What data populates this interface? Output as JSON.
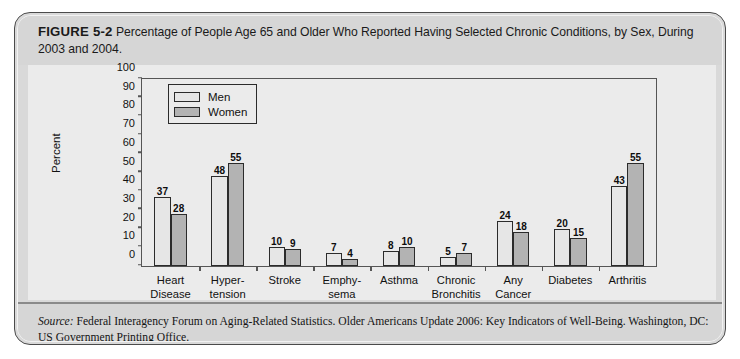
{
  "figure": {
    "label": "FIGURE 5-2",
    "caption": "Percentage of People Age 65 and Older Who Reported Having Selected Chronic Conditions, by Sex, During 2003 and 2004."
  },
  "source": {
    "prefix": "Source:",
    "text": " Federal Interagency Forum on Aging-Related Statistics. Older Americans Update 2006: Key Indicators of Well-Being. Washington, DC: US Government Printing Office."
  },
  "legend": {
    "items": [
      {
        "label": "Men",
        "color": "#e6e6e6"
      },
      {
        "label": "Women",
        "color": "#b3b3b3"
      }
    ]
  },
  "chart_data": {
    "type": "bar",
    "title": "Percentage of People Age 65 and Older Who Reported Having Selected Chronic Conditions, by Sex, During 2003 and 2004.",
    "xlabel": "",
    "ylabel": "Percent",
    "ylim": [
      0,
      100
    ],
    "yticks": [
      0,
      10,
      20,
      30,
      40,
      50,
      60,
      70,
      80,
      90,
      100
    ],
    "grid": false,
    "legend_position": "top-left",
    "categories": [
      "Heart Disease",
      "Hyper-tension",
      "Stroke",
      "Emphy-sema",
      "Asthma",
      "Chronic Bronchitis",
      "Any Cancer",
      "Diabetes",
      "Arthritis"
    ],
    "category_lines": [
      [
        "Heart",
        "Disease"
      ],
      [
        "Hyper-",
        "tension"
      ],
      [
        "Stroke"
      ],
      [
        "Emphy-",
        "sema"
      ],
      [
        "Asthma"
      ],
      [
        "Chronic",
        "Bronchitis"
      ],
      [
        "Any",
        "Cancer"
      ],
      [
        "Diabetes"
      ],
      [
        "Arthritis"
      ]
    ],
    "series": [
      {
        "name": "Men",
        "color": "#e6e6e6",
        "values": [
          37,
          48,
          10,
          7,
          8,
          5,
          24,
          20,
          43
        ]
      },
      {
        "name": "Women",
        "color": "#b3b3b3",
        "values": [
          28,
          55,
          9,
          4,
          10,
          7,
          18,
          15,
          55
        ]
      }
    ]
  }
}
